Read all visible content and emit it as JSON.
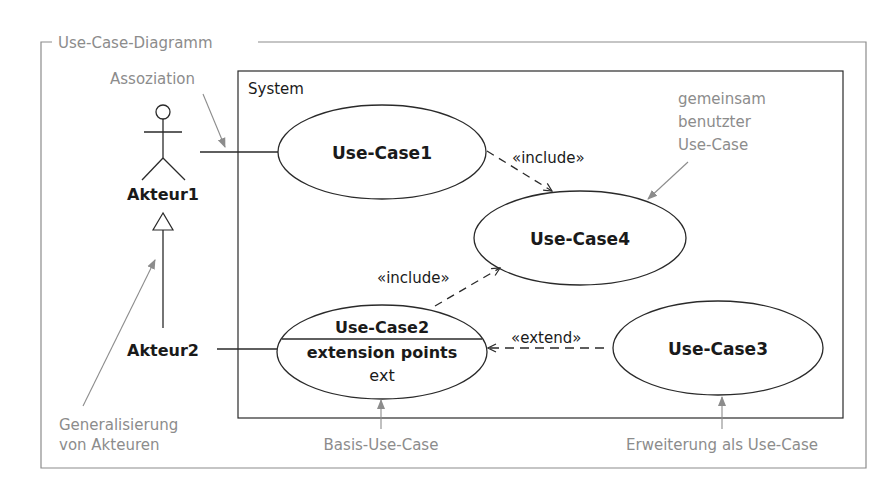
{
  "frame": {
    "title": "Use-Case-Diagramm"
  },
  "system": {
    "label": "System"
  },
  "actors": [
    {
      "id": "akteur1",
      "label": "Akteur1"
    },
    {
      "id": "akteur2",
      "label": "Akteur2"
    }
  ],
  "use_cases": {
    "uc1": {
      "label": "Use-Case1"
    },
    "uc2": {
      "label": "Use-Case2",
      "compartment_title": "extension points",
      "extension_point": "ext"
    },
    "uc3": {
      "label": "Use-Case3"
    },
    "uc4": {
      "label": "Use-Case4"
    }
  },
  "relations": {
    "include1": "«include»",
    "include2": "«include»",
    "extend": "«extend»"
  },
  "annotations": {
    "assoziation": "Assoziation",
    "gemeinsam": [
      "gemeinsam",
      "benutzter",
      "Use-Case"
    ],
    "generalisierung": [
      "Generalisierung",
      "von Akteuren"
    ],
    "basis": "Basis-Use-Case",
    "erweiterung": "Erweiterung als Use-Case"
  },
  "colors": {
    "line": "#2a2a2a",
    "annotation": "#8c8c8c",
    "frame": "#8c8c8c"
  }
}
